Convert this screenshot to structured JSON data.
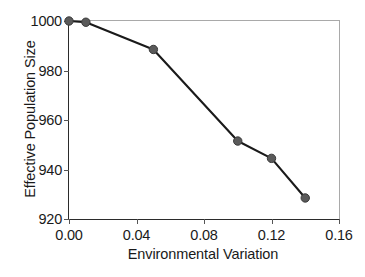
{
  "chart_data": {
    "type": "line",
    "title": "",
    "xlabel": "Environmental Variation",
    "ylabel": "Effective Population Size",
    "xlim": [
      0.0,
      0.16
    ],
    "ylim": [
      920,
      1000
    ],
    "xticks": [
      0.0,
      0.04,
      0.08,
      0.12,
      0.16
    ],
    "xtick_labels": [
      "0.00",
      "0.04",
      "0.08",
      "0.12",
      "0.16"
    ],
    "yticks": [
      920,
      940,
      960,
      980,
      1000
    ],
    "ytick_labels": [
      "920",
      "940",
      "960",
      "980",
      "1000"
    ],
    "grid": false,
    "legend": null,
    "series": [
      {
        "name": "Effective Population Size",
        "x": [
          0.0,
          0.01,
          0.05,
          0.1,
          0.12,
          0.14
        ],
        "values": [
          1000,
          999.5,
          988.5,
          951.5,
          944.5,
          928.5
        ],
        "marker": "circle",
        "marker_color": "#5a5a5a",
        "line_color": "#1a1a1a"
      }
    ]
  },
  "axes": {
    "x_title": "Environmental Variation",
    "y_title": "Effective Population Size"
  },
  "colors": {
    "line": "#1a1a1a",
    "marker": "#5a5a5a",
    "frame": "#a9a9a9",
    "axis": "#2b2b2b",
    "text": "#1a1a1a",
    "background": "#ffffff"
  }
}
